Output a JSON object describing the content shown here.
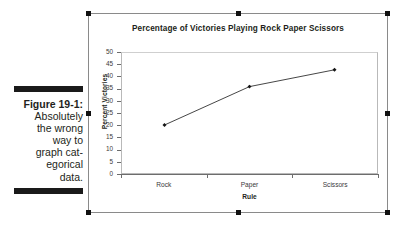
{
  "figure": {
    "label": "Figure 19-1:",
    "caption": "Absolutely\nthe wrong\nway to\ngraph cat-\negorical\ndata."
  },
  "chart_panel": {
    "selected": true,
    "handle_names": [
      "handle-top-left",
      "handle-top-middle",
      "handle-top-right",
      "handle-middle-left",
      "handle-middle-right",
      "handle-bottom-left",
      "handle-bottom-middle",
      "handle-bottom-right"
    ]
  },
  "chart_data": {
    "type": "line",
    "title": "Percentage of Victories Playing Rock Paper Scissors",
    "xlabel": "Rule",
    "ylabel": "Percent Victories",
    "categories": [
      "Rock",
      "Paper",
      "Scissors"
    ],
    "values": [
      20,
      36,
      43
    ],
    "series": [
      {
        "name": "Percent Victories",
        "values": [
          20,
          36,
          43
        ]
      }
    ],
    "ylim": [
      0,
      50
    ],
    "ytick_step": 5,
    "ytick_labels": [
      "0",
      "5",
      "10",
      "15",
      "20",
      "25",
      "30",
      "35",
      "40",
      "45",
      "50"
    ],
    "grid": false,
    "legend": false,
    "marker": "diamond",
    "line_color": "#141414",
    "marker_color": "#141414",
    "plot_background": "#ffffff",
    "axis_color": "#6d6d6d"
  }
}
